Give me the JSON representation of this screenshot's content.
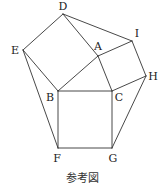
{
  "figure": {
    "caption": "参考図",
    "points": {
      "A": {
        "x": 98,
        "y": 56,
        "label": "A",
        "lx": 98,
        "ly": 50
      },
      "B": {
        "x": 58,
        "y": 91,
        "label": "B",
        "lx": 50,
        "ly": 101
      },
      "C": {
        "x": 112,
        "y": 91,
        "label": "C",
        "lx": 119,
        "ly": 101
      },
      "D": {
        "x": 63,
        "y": 14,
        "label": "D",
        "lx": 63,
        "ly": 10
      },
      "E": {
        "x": 23,
        "y": 50,
        "label": "E",
        "lx": 15,
        "ly": 54
      },
      "F": {
        "x": 58,
        "y": 148,
        "label": "F",
        "lx": 57,
        "ly": 162
      },
      "G": {
        "x": 112,
        "y": 148,
        "label": "G",
        "lx": 113,
        "ly": 162
      },
      "H": {
        "x": 146,
        "y": 76,
        "label": "H",
        "lx": 153,
        "ly": 80
      },
      "I": {
        "x": 132,
        "y": 41,
        "label": "I",
        "lx": 137,
        "ly": 37
      }
    },
    "segments": [
      [
        "D",
        "E"
      ],
      [
        "E",
        "B"
      ],
      [
        "B",
        "A"
      ],
      [
        "A",
        "D"
      ],
      [
        "D",
        "I"
      ],
      [
        "A",
        "I"
      ],
      [
        "I",
        "H"
      ],
      [
        "H",
        "C"
      ],
      [
        "C",
        "A"
      ],
      [
        "B",
        "C"
      ],
      [
        "C",
        "G"
      ],
      [
        "G",
        "F"
      ],
      [
        "F",
        "B"
      ],
      [
        "E",
        "F"
      ],
      [
        "H",
        "G"
      ]
    ]
  }
}
